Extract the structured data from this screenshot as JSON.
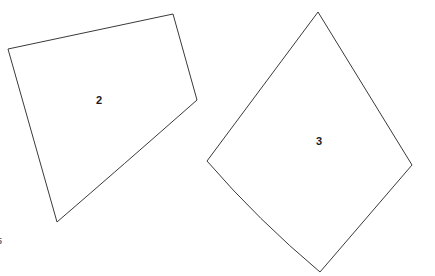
{
  "canvas": {
    "width": 435,
    "height": 276,
    "background_color": "#ffffff",
    "stroke_color": "#3a3a3a",
    "label_color": "#1a1a1a",
    "stroke_width": 1
  },
  "shapes": [
    {
      "label": "2",
      "kind": "polygon",
      "label_x": 99,
      "label_y": 100,
      "vertices": [
        [
          8,
          49
        ],
        [
          173,
          14
        ],
        [
          197,
          100
        ],
        [
          57,
          222
        ]
      ],
      "path": "M 8 49 L 173 14 L 197 100 L 57 222 Q 120 165 197 100 Z",
      "outline_path": "M 8 49 L 173 14 L 197 100 Q 122 166 57 222 Z",
      "fill": "#ffffff"
    },
    {
      "label": "3",
      "kind": "polygon",
      "label_x": 319,
      "label_y": 141,
      "vertices": [
        [
          318,
          12
        ],
        [
          412,
          165
        ],
        [
          320,
          272
        ],
        [
          207,
          161
        ]
      ],
      "path": "M 318 12 L 412 165 L 320 272 L 207 161 Z",
      "outline_path": "M 318 12 L 412 165 L 320 272 Q 258 220 207 161 Z",
      "fill": "#ffffff"
    }
  ],
  "edge_marks": [
    {
      "text": "5",
      "x": 0,
      "y": 237,
      "clipped": true
    }
  ]
}
